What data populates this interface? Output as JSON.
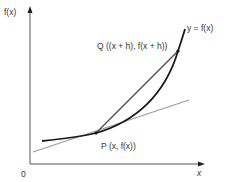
{
  "diagram": {
    "axes": {
      "y_label": "f(x)",
      "x_label": "x",
      "origin_label": "0"
    },
    "curve": {
      "label": "y = f(x)",
      "color": "#1a1a1a"
    },
    "tangent": {
      "color": "#9a9a9a"
    },
    "chord": {
      "color": "#4a4a4a"
    },
    "points": {
      "P": {
        "label": "P (x, f(x))",
        "name": "P"
      },
      "Q": {
        "label": "Q ((x + h), f(x + h))",
        "name": "Q"
      }
    }
  }
}
